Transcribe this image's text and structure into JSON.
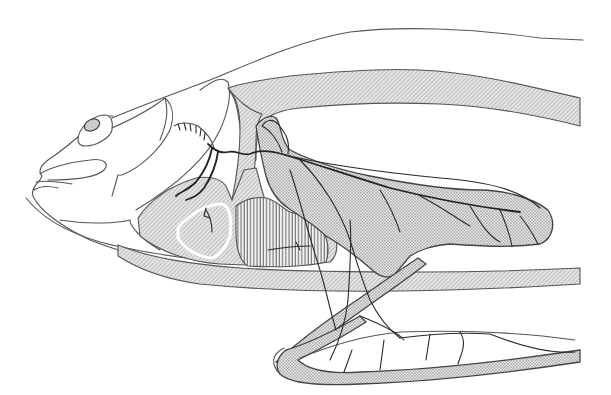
{
  "figure": {
    "orientation": "head facing left",
    "fills": {
      "diagonal_hatch": "#bdbdbd",
      "stipple": "#a8a8a8",
      "vertical_hatch": "#6e6e6e",
      "line": "#444444",
      "background": "#ffffff"
    },
    "regions": [
      {
        "id": "head-outline",
        "style": "outline"
      },
      {
        "id": "eye",
        "style": "stipple"
      },
      {
        "id": "mouth-lips",
        "style": "outline"
      },
      {
        "id": "opercle-skull-arch",
        "style": "diagonal-hatch"
      },
      {
        "id": "dorsal-band",
        "style": "diagonal-hatch"
      },
      {
        "id": "ventral-band",
        "style": "diagonal-hatch"
      },
      {
        "id": "branchial-region",
        "style": "diagonal-hatch"
      },
      {
        "id": "gill-arch-white-outline",
        "style": "outline-white"
      },
      {
        "id": "heart-block",
        "style": "vertical-hatch"
      },
      {
        "id": "muscle-mass",
        "style": "stipple"
      },
      {
        "id": "pectoral-fin-ray",
        "style": "stipple"
      },
      {
        "id": "pelvic-loop",
        "style": "stipple"
      },
      {
        "id": "nerve-branches",
        "style": "dark-lines"
      },
      {
        "id": "spinal-segment-coil",
        "style": "outline"
      }
    ]
  }
}
